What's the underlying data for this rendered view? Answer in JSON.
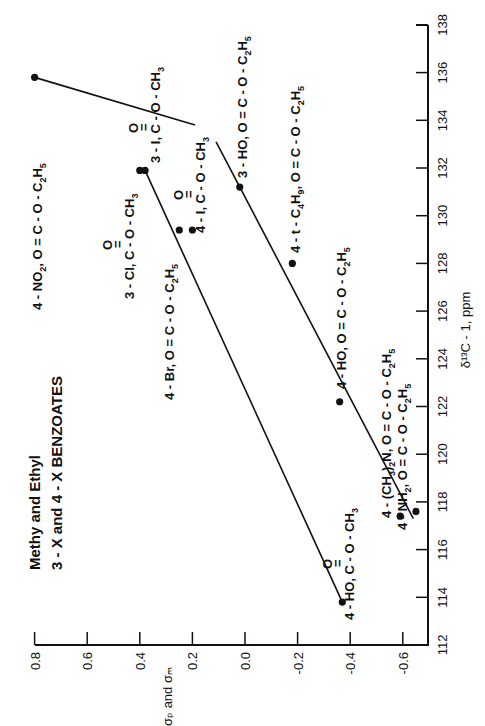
{
  "chart_data": {
    "type": "scatter",
    "title": "Methy and Ethyl",
    "subtitle": "3 - X and 4 - X BENZOATES",
    "orientation": "rotated 90° counter-clockwise (x-axis vertical on right, y-axis horizontal on bottom)",
    "xlabel": "δ13C - 1, ppm",
    "ylabel": "σp and σm",
    "xlim": [
      112,
      138
    ],
    "ylim": [
      -0.7,
      0.8
    ],
    "x_ticks": [
      112,
      114,
      116,
      118,
      120,
      122,
      124,
      126,
      128,
      130,
      132,
      134,
      136,
      138
    ],
    "y_ticks": [
      0.8,
      0.6,
      0.4,
      0.2,
      0.0,
      -0.2,
      -0.4,
      -0.6
    ],
    "y_tick_labels": [
      "0.8",
      "0.6",
      "0.4",
      "0.2",
      "0.0",
      "-0.2",
      "-0.4",
      "-0.6"
    ],
    "grid": false,
    "series": [
      {
        "name": "Methyl benzoates",
        "points": [
          {
            "label": "4 - HO, O=C - O - CH3",
            "x": 113.8,
            "y": -0.37
          },
          {
            "label": "4 - Br, O = C - O - C2H5",
            "x": 129.4,
            "y": 0.25
          },
          {
            "label": "4 - I, O=C - O - CH3",
            "x": 129.4,
            "y": 0.2
          },
          {
            "label": "3 - Cl, O=C - O - CH3",
            "x": 131.9,
            "y": 0.4
          },
          {
            "label": "3 - I, O=C - O - CH3",
            "x": 131.9,
            "y": 0.38
          }
        ],
        "fit_line": {
          "from": {
            "x": 113.8,
            "y": -0.37
          },
          "to": {
            "x": 131.9,
            "y": 0.38
          }
        }
      },
      {
        "name": "Ethyl benzoates",
        "points": [
          {
            "label": "4 - NH2, O = C - O - C2H5",
            "x": 117.6,
            "y": -0.65
          },
          {
            "label": "4 - (CH3)2N, O = C - O - C2H5",
            "x": 117.4,
            "y": -0.59
          },
          {
            "label": "4 - HO, O = C - O - C2H5",
            "x": 122.2,
            "y": -0.36
          },
          {
            "label": "4 - t - C4H9, O = C - O - C2H5",
            "x": 128.0,
            "y": -0.18
          },
          {
            "label": "3 - HO, O = C - O - C2H5",
            "x": 131.2,
            "y": 0.02
          },
          {
            "label": "4 - NO2, O = C - O - C2H5",
            "x": 135.8,
            "y": 0.8
          }
        ],
        "fit_line_segments": [
          {
            "from": {
              "x": 117.3,
              "y": -0.64
            },
            "to": {
              "x": 133.1,
              "y": 0.11
            }
          },
          {
            "from": {
              "x": 133.8,
              "y": 0.19
            },
            "to": {
              "x": 135.8,
              "y": 0.8
            }
          }
        ]
      }
    ]
  },
  "labels": {
    "title": "Methy and Ethyl",
    "subtitle": "3 - X and 4 - X BENZOATES",
    "xlabel": "δ¹³C - 1, ppm",
    "ylabel": "σₚ and σₘ"
  },
  "point_labels": [
    {
      "id": "no2",
      "prefix": "4 - NO",
      "sub1": "2",
      "mid": ", O = C - O - C",
      "sub2": "2",
      "h": "H",
      "sub3": "5"
    },
    {
      "id": "3i",
      "text": "3 - I, C - O - CH",
      "sub": "3",
      "carbonyl": "O"
    },
    {
      "id": "3ho",
      "prefix": "3 - HO, O = C - O - C",
      "sub1": "2",
      "h": "H",
      "sub2": "5"
    },
    {
      "id": "3cl",
      "text": "3 - Cl, C - O - CH",
      "sub": "3",
      "carbonyl": "O"
    },
    {
      "id": "4i",
      "text": "4 - I, C - O - CH",
      "sub": "3",
      "carbonyl": "O"
    },
    {
      "id": "tbu",
      "prefix": "4 - t - C",
      "sub1": "4",
      "h": "H",
      "sub2": "9",
      "mid": ", O = C - O - C",
      "sub3": "2",
      "h2": "H",
      "sub4": "5"
    },
    {
      "id": "4br",
      "prefix": "4 - Br, O = C - O - C",
      "sub1": "2",
      "h": "H",
      "sub2": "5"
    },
    {
      "id": "4ho_et",
      "prefix": "4 - HO, O = C - O - C",
      "sub1": "2",
      "h": "H",
      "sub2": "5"
    },
    {
      "id": "nme2",
      "prefix": "4 - (CH",
      "sub1": "3",
      "mid": ")",
      "sub2": "2",
      "rest": "N, O = C - O - C",
      "sub3": "2",
      "h": "H",
      "sub4": "5"
    },
    {
      "id": "nh2",
      "prefix": "4 - NH",
      "sub1": "2",
      "mid": ", O = C - O - C",
      "sub2": "2",
      "h": "H",
      "sub3": "5"
    },
    {
      "id": "4ho_me",
      "text": "4 - HO, C - O - CH",
      "sub": "3",
      "carbonyl": "O"
    }
  ]
}
